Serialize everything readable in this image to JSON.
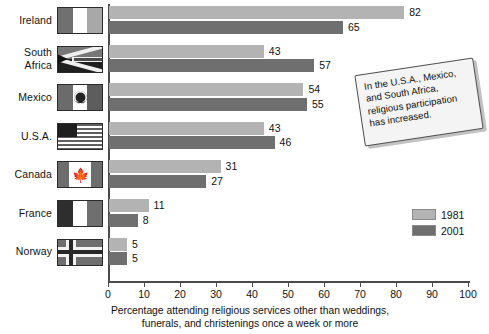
{
  "chart_data": {
    "type": "bar",
    "orientation": "horizontal",
    "title": "",
    "xlabel": "Percentage attending religious services other than weddings, funerals, and christenings once a week or more",
    "ylabel": "",
    "xlim": [
      0,
      100
    ],
    "xticks": [
      0,
      10,
      20,
      30,
      40,
      50,
      60,
      70,
      80,
      90,
      100
    ],
    "grid": false,
    "legend_position": "bottom-right",
    "categories": [
      "Ireland",
      "South Africa",
      "Mexico",
      "U.S.A.",
      "Canada",
      "France",
      "Norway"
    ],
    "series": [
      {
        "name": "1981",
        "color": "#b3b3b3",
        "values": [
          82,
          43,
          54,
          43,
          31,
          11,
          5
        ]
      },
      {
        "name": "2001",
        "color": "#6f6f6f",
        "values": [
          65,
          57,
          55,
          46,
          27,
          8,
          5
        ]
      }
    ],
    "annotations": [
      "In the U.S.A., Mexico, and South Africa, religious participation has increased."
    ]
  },
  "rows": [
    {
      "country": "Ireland",
      "label_lines": [
        "Ireland"
      ],
      "flag": "flag-ireland",
      "v1981": 82,
      "v2001": 65
    },
    {
      "country": "South Africa",
      "label_lines": [
        "South",
        "Africa"
      ],
      "flag": "flag-south-africa",
      "v1981": 43,
      "v2001": 57
    },
    {
      "country": "Mexico",
      "label_lines": [
        "Mexico"
      ],
      "flag": "flag-mexico",
      "v1981": 54,
      "v2001": 55
    },
    {
      "country": "U.S.A.",
      "label_lines": [
        "U.S.A."
      ],
      "flag": "flag-usa",
      "v1981": 43,
      "v2001": 46
    },
    {
      "country": "Canada",
      "label_lines": [
        "Canada"
      ],
      "flag": "flag-canada",
      "v1981": 31,
      "v2001": 27
    },
    {
      "country": "France",
      "label_lines": [
        "France"
      ],
      "flag": "flag-france",
      "v1981": 11,
      "v2001": 8
    },
    {
      "country": "Norway",
      "label_lines": [
        "Norway"
      ],
      "flag": "flag-norway",
      "v1981": 5,
      "v2001": 5
    }
  ],
  "axis": {
    "ticks": [
      "0",
      "10",
      "20",
      "30",
      "40",
      "50",
      "60",
      "70",
      "80",
      "90",
      "100"
    ],
    "caption_line1": "Percentage attending religious services other than weddings,",
    "caption_line2": "funerals, and christenings once a week or more"
  },
  "legend": {
    "entries": [
      {
        "label": "1981",
        "color": "#b3b3b3"
      },
      {
        "label": "2001",
        "color": "#6f6f6f"
      }
    ]
  },
  "callout": {
    "text": "In the U.S.A., Mexico, and South Africa, religious participation has increased."
  }
}
